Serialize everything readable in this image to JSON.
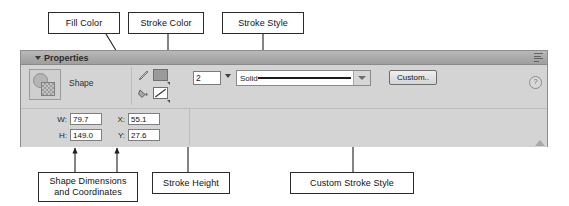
{
  "callouts": {
    "fill_color": "Fill Color",
    "stroke_color": "Stroke Color",
    "stroke_style": "Stroke Style",
    "shape_dimensions": "Shape Dimensions",
    "and_coordinates": "and Coordinates",
    "stroke_height": "Stroke Height",
    "custom_stroke_style": "Custom Stroke Style"
  },
  "panel": {
    "title": "Properties",
    "collapse_icon": "triangle-down-icon",
    "menu_icon": "panel-menu-icon",
    "help_icon": "?",
    "resize_icon": "resize-grip-icon"
  },
  "object": {
    "type_label": "Shape",
    "thumbnail_icon": "shape-thumbnail-icon"
  },
  "stroke": {
    "color_swatch_icon": "stroke-color-swatch",
    "pencil_icon": "pencil-icon",
    "height_value": "2",
    "height_caret_icon": "caret-down-icon",
    "style_value": "Solid",
    "style_caret_icon": "chevron-down-icon",
    "custom_button_label": "Custom.."
  },
  "fill": {
    "color_swatch_icon": "fill-color-swatch",
    "bucket_icon": "paint-bucket-icon"
  },
  "dimensions": [
    {
      "label": "W:",
      "value": "79.7"
    },
    {
      "label": "X:",
      "value": "55.1"
    },
    {
      "label": "H:",
      "value": "149.0"
    },
    {
      "label": "Y:",
      "value": "27.6"
    }
  ],
  "colors": {
    "panel_bg": "#d4d4d4",
    "titlebar": "#a9a9a9",
    "border": "#8d8d8d",
    "field_bg": "#ffffff",
    "text": "#1a1a1a"
  }
}
